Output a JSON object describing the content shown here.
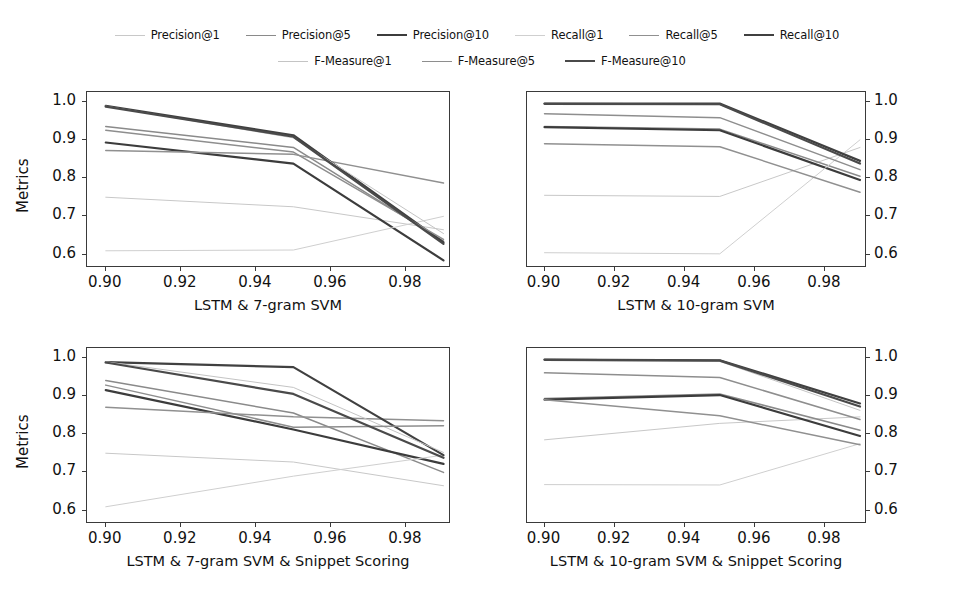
{
  "figure": {
    "ylabel": "Metrics",
    "xticks": [
      "0.90",
      "0.92",
      "0.94",
      "0.96",
      "0.98"
    ],
    "xtick_values": [
      0.9,
      0.92,
      0.94,
      0.96,
      0.98
    ],
    "yticks": [
      "0.6",
      "0.7",
      "0.8",
      "0.9",
      "1.0"
    ],
    "ytick_values": [
      0.6,
      0.7,
      0.8,
      0.9,
      1.0
    ],
    "xlim": [
      0.895,
      0.992
    ],
    "ylim": [
      0.565,
      1.025
    ]
  },
  "legend": {
    "position": "top-center",
    "rows": [
      [
        {
          "label": "Precision@1",
          "color": "#c8c8c8",
          "width": 1.0
        },
        {
          "label": "Precision@5",
          "color": "#8a8a8a",
          "width": 1.5
        },
        {
          "label": "Precision@10",
          "color": "#3c3c3c",
          "width": 2.2
        },
        {
          "label": "Recall@1",
          "color": "#cfcfcf",
          "width": 1.0
        },
        {
          "label": "Recall@5",
          "color": "#909090",
          "width": 1.5
        },
        {
          "label": "Recall@10",
          "color": "#404040",
          "width": 2.2
        }
      ],
      [
        {
          "label": "F-Measure@1",
          "color": "#c4c4c4",
          "width": 1.0
        },
        {
          "label": "F-Measure@5",
          "color": "#8e8e8e",
          "width": 1.5
        },
        {
          "label": "F-Measure@10",
          "color": "#4a4a4a",
          "width": 2.2
        }
      ]
    ]
  },
  "chart_data": [
    {
      "type": "line",
      "panel": "top-left",
      "title": "LSTM & 7-gram SVM",
      "xlabel": "LSTM & 7-gram SVM",
      "ylabel": "Metrics",
      "x": [
        0.9,
        0.95,
        0.99
      ],
      "xlim": [
        0.895,
        0.992
      ],
      "ylim": [
        0.565,
        1.025
      ],
      "yaxis_side": "left",
      "grid": false,
      "series": [
        {
          "name": "Precision@1",
          "color": "#c8c8c8",
          "width": 1.0,
          "values": [
            0.75,
            0.725,
            0.665
          ]
        },
        {
          "name": "Precision@5",
          "color": "#8a8a8a",
          "width": 1.5,
          "values": [
            0.935,
            0.88,
            0.635
          ]
        },
        {
          "name": "Precision@10",
          "color": "#3c3c3c",
          "width": 2.2,
          "values": [
            0.893,
            0.838,
            0.585
          ]
        },
        {
          "name": "Recall@1",
          "color": "#cfcfcf",
          "width": 1.0,
          "values": [
            0.61,
            0.612,
            0.7
          ]
        },
        {
          "name": "Recall@5",
          "color": "#909090",
          "width": 1.5,
          "values": [
            0.872,
            0.862,
            0.787
          ]
        },
        {
          "name": "Recall@10",
          "color": "#404040",
          "width": 2.2,
          "values": [
            0.989,
            0.912,
            0.632
          ]
        },
        {
          "name": "F-Measure@1",
          "color": "#c4c4c4",
          "width": 1.0,
          "values": [
            0.988,
            0.905,
            0.655
          ]
        },
        {
          "name": "F-Measure@5",
          "color": "#8e8e8e",
          "width": 1.5,
          "values": [
            0.925,
            0.868,
            0.64
          ]
        },
        {
          "name": "F-Measure@10",
          "color": "#4a4a4a",
          "width": 2.2,
          "values": [
            0.987,
            0.908,
            0.628
          ]
        }
      ]
    },
    {
      "type": "line",
      "panel": "top-right",
      "title": "LSTM & 10-gram SVM",
      "xlabel": "LSTM & 10-gram SVM",
      "ylabel": "",
      "x": [
        0.9,
        0.95,
        0.99
      ],
      "xlim": [
        0.895,
        0.992
      ],
      "ylim": [
        0.565,
        1.025
      ],
      "yaxis_side": "right",
      "grid": false,
      "series": [
        {
          "name": "Precision@1",
          "color": "#c8c8c8",
          "width": 1.0,
          "values": [
            0.755,
            0.752,
            0.88
          ]
        },
        {
          "name": "Precision@5",
          "color": "#8a8a8a",
          "width": 1.5,
          "values": [
            0.935,
            0.928,
            0.805
          ]
        },
        {
          "name": "Precision@10",
          "color": "#3c3c3c",
          "width": 2.2,
          "values": [
            0.933,
            0.925,
            0.795
          ]
        },
        {
          "name": "Recall@1",
          "color": "#cfcfcf",
          "width": 1.0,
          "values": [
            0.605,
            0.602,
            0.9
          ]
        },
        {
          "name": "Recall@5",
          "color": "#909090",
          "width": 1.5,
          "values": [
            0.89,
            0.882,
            0.763
          ]
        },
        {
          "name": "Recall@10",
          "color": "#404040",
          "width": 2.2,
          "values": [
            0.995,
            0.995,
            0.845
          ]
        },
        {
          "name": "F-Measure@1",
          "color": "#c4c4c4",
          "width": 1.0,
          "values": [
            0.993,
            0.992,
            0.84
          ]
        },
        {
          "name": "F-Measure@5",
          "color": "#8e8e8e",
          "width": 1.5,
          "values": [
            0.968,
            0.958,
            0.822
          ]
        },
        {
          "name": "F-Measure@10",
          "color": "#4a4a4a",
          "width": 2.2,
          "values": [
            0.994,
            0.993,
            0.838
          ]
        }
      ]
    },
    {
      "type": "line",
      "panel": "bottom-left",
      "title": "LSTM & 7-gram SVM & Snippet Scoring",
      "xlabel": "LSTM & 7-gram SVM & Snippet Scoring",
      "ylabel": "Metrics",
      "x": [
        0.9,
        0.95,
        0.99
      ],
      "xlim": [
        0.895,
        0.992
      ],
      "ylim": [
        0.565,
        1.025
      ],
      "yaxis_side": "left",
      "grid": false,
      "series": [
        {
          "name": "Precision@1",
          "color": "#c8c8c8",
          "width": 1.0,
          "values": [
            0.75,
            0.727,
            0.665
          ]
        },
        {
          "name": "Precision@5",
          "color": "#8a8a8a",
          "width": 1.5,
          "values": [
            0.94,
            0.855,
            0.7
          ]
        },
        {
          "name": "Precision@10",
          "color": "#3c3c3c",
          "width": 2.2,
          "values": [
            0.915,
            0.812,
            0.722
          ]
        },
        {
          "name": "Recall@1",
          "color": "#cfcfcf",
          "width": 1.0,
          "values": [
            0.61,
            0.69,
            0.745
          ]
        },
        {
          "name": "Recall@5",
          "color": "#909090",
          "width": 1.5,
          "values": [
            0.87,
            0.845,
            0.835
          ]
        },
        {
          "name": "Recall@10",
          "color": "#404040",
          "width": 2.2,
          "values": [
            0.988,
            0.975,
            0.745
          ]
        },
        {
          "name": "F-Measure@1",
          "color": "#c4c4c4",
          "width": 1.0,
          "values": [
            0.989,
            0.922,
            0.752
          ]
        },
        {
          "name": "F-Measure@5",
          "color": "#8e8e8e",
          "width": 1.5,
          "values": [
            0.928,
            0.818,
            0.822
          ]
        },
        {
          "name": "F-Measure@10",
          "color": "#4a4a4a",
          "width": 2.2,
          "values": [
            0.987,
            0.905,
            0.738
          ]
        }
      ]
    },
    {
      "type": "line",
      "panel": "bottom-right",
      "title": "LSTM & 10-gram SVM & Snippet Scoring",
      "xlabel": "LSTM & 10-gram SVM & Snippet Scoring",
      "ylabel": "",
      "x": [
        0.9,
        0.95,
        0.99
      ],
      "xlim": [
        0.895,
        0.992
      ],
      "ylim": [
        0.565,
        1.025
      ],
      "yaxis_side": "right",
      "grid": false,
      "series": [
        {
          "name": "Precision@1",
          "color": "#c8c8c8",
          "width": 1.0,
          "values": [
            0.785,
            0.828,
            0.845
          ]
        },
        {
          "name": "Precision@5",
          "color": "#8a8a8a",
          "width": 1.5,
          "values": [
            0.893,
            0.905,
            0.81
          ]
        },
        {
          "name": "Precision@10",
          "color": "#3c3c3c",
          "width": 2.2,
          "values": [
            0.89,
            0.902,
            0.795
          ]
        },
        {
          "name": "Recall@1",
          "color": "#cfcfcf",
          "width": 1.0,
          "values": [
            0.668,
            0.667,
            0.775
          ]
        },
        {
          "name": "Recall@5",
          "color": "#909090",
          "width": 1.5,
          "values": [
            0.89,
            0.848,
            0.772
          ]
        },
        {
          "name": "Recall@10",
          "color": "#404040",
          "width": 2.2,
          "values": [
            0.995,
            0.993,
            0.88
          ]
        },
        {
          "name": "F-Measure@1",
          "color": "#c4c4c4",
          "width": 1.0,
          "values": [
            0.993,
            0.99,
            0.862
          ]
        },
        {
          "name": "F-Measure@5",
          "color": "#8e8e8e",
          "width": 1.5,
          "values": [
            0.96,
            0.948,
            0.838
          ]
        },
        {
          "name": "F-Measure@10",
          "color": "#4a4a4a",
          "width": 2.2,
          "values": [
            0.994,
            0.992,
            0.872
          ]
        }
      ]
    }
  ]
}
